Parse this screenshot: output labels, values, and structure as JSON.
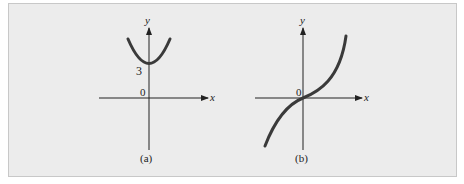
{
  "figure": {
    "background": "#ececec",
    "border_color": "#c8c8c8",
    "curve_color": "#3a3a3a",
    "axis_color": "#222222",
    "panels": [
      {
        "id": "a",
        "caption": "(a)",
        "x_axis_label": "x",
        "y_axis_label": "y",
        "origin_label": "0",
        "intercept_label": "3",
        "curve": "parabola opening upward with minimum at (0, 3)"
      },
      {
        "id": "b",
        "caption": "(b)",
        "x_axis_label": "x",
        "y_axis_label": "y",
        "origin_label": "0",
        "curve": "increasing cubic-like curve passing through origin"
      }
    ]
  }
}
